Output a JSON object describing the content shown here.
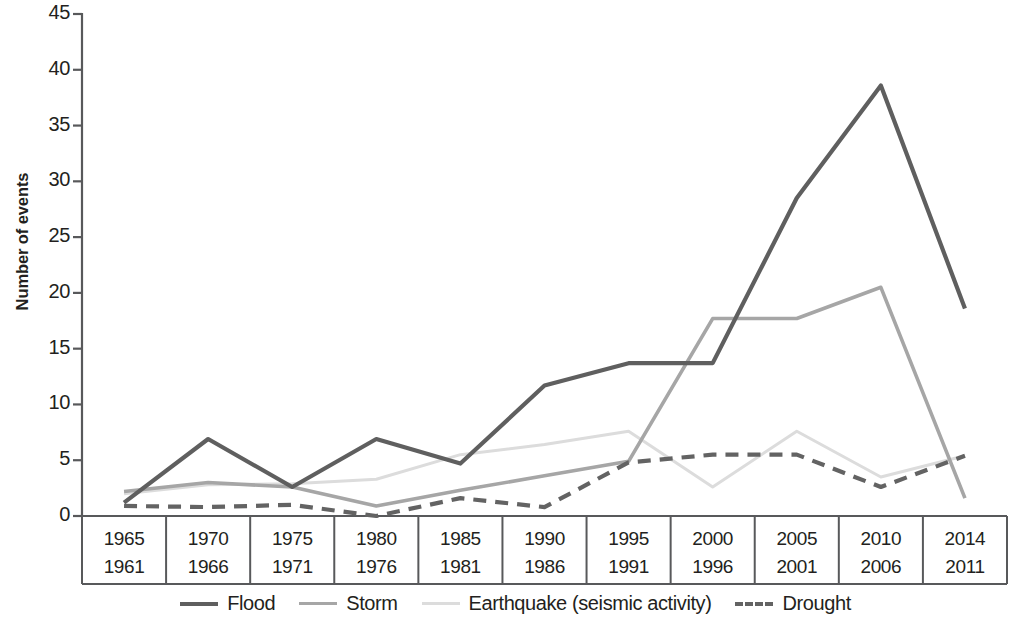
{
  "chart_data": {
    "type": "line",
    "title": "",
    "xlabel": "",
    "ylabel": "Number of events",
    "ylim": [
      0,
      45
    ],
    "yticks": [
      0,
      5,
      10,
      15,
      20,
      25,
      30,
      35,
      40,
      45
    ],
    "grid": false,
    "legend_position": "bottom",
    "categories": [
      "1965",
      "1970",
      "1975",
      "1980",
      "1985",
      "1990",
      "1995",
      "2000",
      "2005",
      "2010",
      "2014"
    ],
    "categories_start": [
      "1961",
      "1966",
      "1971",
      "1976",
      "1981",
      "1986",
      "1991",
      "1996",
      "2001",
      "2006",
      "2011"
    ],
    "series": [
      {
        "name": "Flood",
        "color": "#5f5f5f",
        "style": "solid",
        "width": 4.2,
        "values": [
          1.2,
          6.9,
          2.6,
          6.9,
          4.7,
          11.7,
          13.7,
          13.7,
          28.5,
          38.6,
          18.6
        ]
      },
      {
        "name": "Storm",
        "color": "#a6a6a6",
        "style": "solid",
        "width": 3.6,
        "values": [
          2.2,
          3.0,
          2.6,
          0.9,
          2.3,
          3.6,
          4.9,
          17.7,
          17.7,
          20.5,
          1.6
        ]
      },
      {
        "name": "Earthquake (seismic activity)",
        "color": "#dcdcdc",
        "style": "solid",
        "width": 3.0,
        "values": [
          2.0,
          2.8,
          2.9,
          3.3,
          5.5,
          6.4,
          7.6,
          2.6,
          7.6,
          3.5,
          5.4
        ]
      },
      {
        "name": "Drought",
        "color": "#636363",
        "style": "dashed",
        "width": 4.2,
        "values": [
          0.9,
          0.8,
          1.0,
          0.0,
          1.6,
          0.8,
          4.8,
          5.5,
          5.5,
          2.6,
          5.4
        ]
      }
    ]
  },
  "axis": {
    "y_title": "Number of events"
  }
}
